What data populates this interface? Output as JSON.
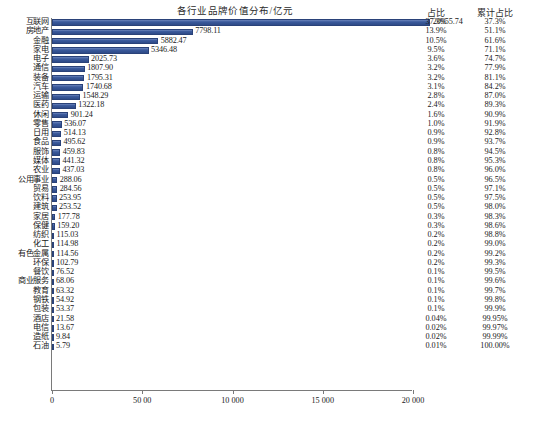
{
  "chart_data": {
    "type": "bar",
    "orientation": "horizontal",
    "title": "各行业品牌价值分布/亿元",
    "xlabel": "",
    "ylabel": "",
    "xlim": [
      0,
      20000
    ],
    "grid": false,
    "legend": "none",
    "bar_color": "#3b5a9c",
    "axis_color": "#7a7a7a",
    "x_ticks": [
      {
        "value": 0,
        "label": "0"
      },
      {
        "value": 5000,
        "label": "50 00"
      },
      {
        "value": 10000,
        "label": "10 000"
      },
      {
        "value": 15000,
        "label": "15 000"
      },
      {
        "value": 20000,
        "label": "20 000"
      }
    ],
    "columns": {
      "share": "占比",
      "cumulative": "累计占比"
    },
    "categories": [
      "互联网",
      "房地产",
      "金融",
      "家电",
      "电子",
      "通信",
      "装备",
      "汽车",
      "运输",
      "医药",
      "休闲",
      "零售",
      "日用",
      "食品",
      "服饰",
      "媒体",
      "农业",
      "公用事业",
      "贸易",
      "饮料",
      "建筑",
      "家居",
      "保健",
      "纺织",
      "化工",
      "有色金属",
      "环保",
      "餐饮",
      "商业服务",
      "教育",
      "钢铁",
      "包装",
      "酒店",
      "电信",
      "造纸",
      "石油"
    ],
    "values": [
      20955.74,
      7798.11,
      5882.47,
      5346.48,
      2025.73,
      1807.9,
      1795.31,
      1740.68,
      1548.29,
      1322.18,
      901.24,
      536.07,
      514.13,
      495.62,
      459.83,
      441.32,
      437.03,
      288.06,
      284.56,
      253.95,
      253.52,
      177.78,
      159.2,
      115.03,
      114.98,
      114.56,
      102.79,
      76.52,
      68.06,
      63.32,
      54.92,
      53.37,
      21.58,
      13.67,
      9.84,
      5.79
    ],
    "value_labels": [
      "20955.74",
      "7798.11",
      "5882.47",
      "5346.48",
      "2025.73",
      "1807.90",
      "1795.31",
      "1740.68",
      "1548.29",
      "1322.18",
      "901.24",
      "536.07",
      "514.13",
      "495.62",
      "459.83",
      "441.32",
      "437.03",
      "288.06",
      "284.56",
      "253.95",
      "253.52",
      "177.78",
      "159.20",
      "115.03",
      "114.98",
      "114.56",
      "102.79",
      "76.52",
      "68.06",
      "63.32",
      "54.92",
      "53.37",
      "21.58",
      "13.67",
      "9.84",
      "5.79"
    ],
    "share_pct": [
      "37.3%",
      "13.9%",
      "10.5%",
      "9.5%",
      "3.6%",
      "3.2%",
      "3.2%",
      "3.1%",
      "2.8%",
      "2.4%",
      "1.6%",
      "1.0%",
      "0.9%",
      "0.9%",
      "0.8%",
      "0.8%",
      "0.8%",
      "0.5%",
      "0.5%",
      "0.5%",
      "0.5%",
      "0.3%",
      "0.3%",
      "0.2%",
      "0.2%",
      "0.2%",
      "0.2%",
      "0.1%",
      "0.1%",
      "0.1%",
      "0.1%",
      "0.1%",
      "0.04%",
      "0.02%",
      "0.02%",
      "0.01%"
    ],
    "cumulative_pct": [
      "37.3%",
      "51.1%",
      "61.6%",
      "71.1%",
      "74.7%",
      "77.9%",
      "81.1%",
      "84.2%",
      "87.0%",
      "89.3%",
      "90.9%",
      "91.9%",
      "92.8%",
      "93.7%",
      "94.5%",
      "95.3%",
      "96.0%",
      "96.5%",
      "97.1%",
      "97.5%",
      "98.0%",
      "98.3%",
      "98.6%",
      "98.8%",
      "99.0%",
      "99.2%",
      "99.3%",
      "99.5%",
      "99.6%",
      "99.7%",
      "99.8%",
      "99.9%",
      "99.95%",
      "99.97%",
      "99.99%",
      "100.00%"
    ]
  }
}
